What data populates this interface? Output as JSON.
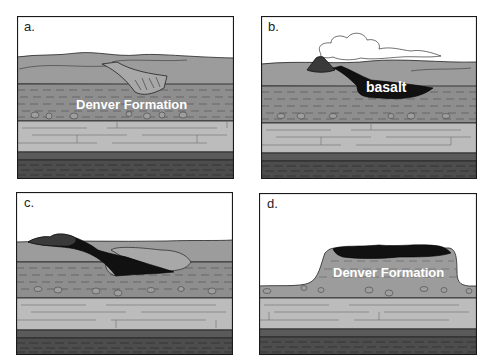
{
  "figure": {
    "panels": [
      {
        "id": "a",
        "label": "a.",
        "caption_text": "Denver Formation"
      },
      {
        "id": "b",
        "label": "b.",
        "caption_text": "basalt"
      },
      {
        "id": "c",
        "label": "c.",
        "caption_text": ""
      },
      {
        "id": "d",
        "label": "d.",
        "caption_text": "Denver Formation"
      }
    ],
    "colors": {
      "sky": "#ffffff",
      "top_layer": "#9c9c9c",
      "shale_layer": "#8e8e8e",
      "sandstone_layer": "#bcbcbc",
      "dark_band": "#5a5a5a",
      "bottom_layer": "#4d4d4d",
      "basalt": "#111111",
      "outline": "#1a1a1a"
    }
  }
}
